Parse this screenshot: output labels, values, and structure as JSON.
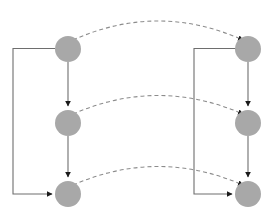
{
  "diagram": {
    "canvas": {
      "width": 268,
      "height": 218,
      "background": "#ffffff"
    },
    "style": {
      "node_fill": "#a8a8a8",
      "solid_edge_color": "#6e6e6e",
      "dashed_edge_color": "#8c8c8c",
      "arrow_color": "#1a1a1a",
      "node_radius": 13,
      "dash_pattern": "4 3"
    },
    "columns": [
      {
        "name": "left-column",
        "x": 68
      },
      {
        "name": "right-column",
        "x": 248
      }
    ],
    "rows": [
      {
        "name": "top-row",
        "y": 49
      },
      {
        "name": "middle-row",
        "y": 123
      },
      {
        "name": "bottom-row",
        "y": 194
      }
    ],
    "nodes": [
      {
        "id": "left-top",
        "label": "",
        "cx": 68,
        "cy": 49,
        "r": 13
      },
      {
        "id": "left-middle",
        "label": "",
        "cx": 68,
        "cy": 123,
        "r": 13
      },
      {
        "id": "left-bottom",
        "label": "",
        "cx": 68,
        "cy": 194,
        "r": 13
      },
      {
        "id": "right-top",
        "label": "",
        "cx": 248,
        "cy": 49,
        "r": 13
      },
      {
        "id": "right-middle",
        "label": "",
        "cx": 248,
        "cy": 123,
        "r": 13
      },
      {
        "id": "right-bottom",
        "label": "",
        "cx": 248,
        "cy": 194,
        "r": 13
      }
    ],
    "solid_edges": [
      {
        "id": "left-top-to-middle",
        "from": "left-top",
        "to": "left-middle",
        "kind": "vertical",
        "arrow": true
      },
      {
        "id": "left-middle-to-bottom",
        "from": "left-middle",
        "to": "left-bottom",
        "kind": "vertical",
        "arrow": true
      },
      {
        "id": "right-top-to-middle",
        "from": "right-top",
        "to": "right-middle",
        "kind": "vertical",
        "arrow": true
      },
      {
        "id": "right-middle-to-bottom",
        "from": "right-middle",
        "to": "right-bottom",
        "kind": "vertical",
        "arrow": true
      },
      {
        "id": "left-feedback-loop",
        "from": "left-top",
        "to": "left-bottom",
        "kind": "loop",
        "arrow": true
      },
      {
        "id": "right-feedback-loop",
        "from": "right-top",
        "to": "right-bottom",
        "kind": "loop",
        "arrow": true
      }
    ],
    "dashed_edges": [
      {
        "id": "dashed-top",
        "from": "left-top",
        "to": "right-top",
        "arrow": true,
        "peak_y": 14
      },
      {
        "id": "dashed-middle",
        "from": "left-middle",
        "to": "right-middle",
        "arrow": true,
        "peak_y": 89
      },
      {
        "id": "dashed-bottom",
        "from": "left-bottom",
        "to": "right-bottom",
        "arrow": true,
        "peak_y": 159
      }
    ]
  }
}
